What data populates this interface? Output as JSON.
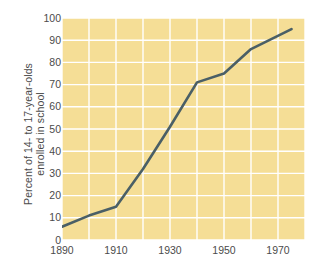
{
  "chart_data": {
    "type": "line",
    "title": "",
    "subtitle": "",
    "xlabel": "",
    "ylabel": "Percent of 14- to 17-year-olds enrolled in school",
    "ylabel_lines": [
      "Percent of 14- to 17-year-olds",
      "enrolled in school"
    ],
    "xlim": [
      1890,
      1980
    ],
    "ylim": [
      0,
      100
    ],
    "x_ticks": [
      1890,
      1910,
      1930,
      1950,
      1970
    ],
    "x_tick_labels": [
      "1890",
      "1910",
      "1930",
      "1950",
      "1970"
    ],
    "x_minor_gridlines": [
      1890,
      1900,
      1910,
      1920,
      1930,
      1940,
      1950,
      1960,
      1970,
      1980
    ],
    "y_ticks": [
      0,
      10,
      20,
      30,
      40,
      50,
      60,
      70,
      80,
      90,
      100
    ],
    "y_tick_labels": [
      "0",
      "10",
      "20",
      "30",
      "40",
      "50",
      "60",
      "70",
      "80",
      "90",
      "100"
    ],
    "grid": true,
    "grid_color": "#ffffff",
    "legend": null,
    "legend_position": "none",
    "plot_background": "#f5de96",
    "series": [
      {
        "name": "Percent of 14- to 17-year-olds enrolled in school",
        "color": "#4a5f66",
        "line_width": 2.6,
        "x": [
          1890,
          1900,
          1910,
          1920,
          1930,
          1940,
          1950,
          1960,
          1975
        ],
        "values": [
          6,
          11,
          15,
          32,
          51,
          71,
          75,
          86,
          95
        ]
      }
    ]
  }
}
